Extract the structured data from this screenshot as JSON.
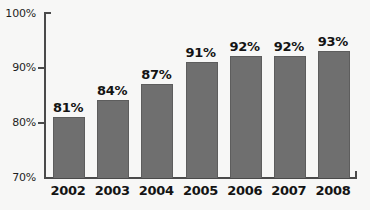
{
  "chart_data": {
    "type": "bar",
    "title": "",
    "xlabel": "",
    "ylabel": "",
    "categories": [
      "2002",
      "2003",
      "2004",
      "2005",
      "2006",
      "2007",
      "2008"
    ],
    "values": [
      81,
      84,
      87,
      91,
      92,
      92,
      93
    ],
    "data_labels": [
      "81%",
      "84%",
      "87%",
      "91%",
      "92%",
      "92%",
      "93%"
    ],
    "ylim": [
      70,
      100
    ],
    "yticks": [
      70,
      80,
      90,
      100
    ],
    "ytick_labels": [
      "70%",
      "80%",
      "90%",
      "100%"
    ],
    "grid": false,
    "legend": false,
    "legend_position": "none",
    "series": [
      {
        "name": "",
        "values": [
          81,
          84,
          87,
          91,
          92,
          92,
          93
        ]
      }
    ],
    "colors": {
      "bar_fill": "#6f6f6f",
      "bar_stroke": "#5d5d5d",
      "axis": "#4a4a4a",
      "text": "#141414",
      "background": "#f7f7f6"
    }
  },
  "axis": {
    "y_labels": [
      "100%",
      "90%",
      "80%",
      "70%"
    ],
    "x_labels": [
      "2002",
      "2003",
      "2004",
      "2005",
      "2006",
      "2007",
      "2008"
    ]
  }
}
